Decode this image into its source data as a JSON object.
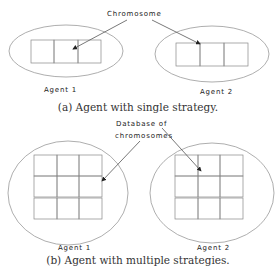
{
  "figure_a": {
    "callout": "Chromosome",
    "agents": [
      "Agent 1",
      "Agent 2"
    ],
    "caption": "(a)  Agent with single strategy."
  },
  "figure_b": {
    "callout_line1": "Database of",
    "callout_line2": "chromosomes",
    "agents": [
      "Agent 1",
      "Agent 2"
    ],
    "caption": "(b)  Agent with multiple strategies."
  }
}
